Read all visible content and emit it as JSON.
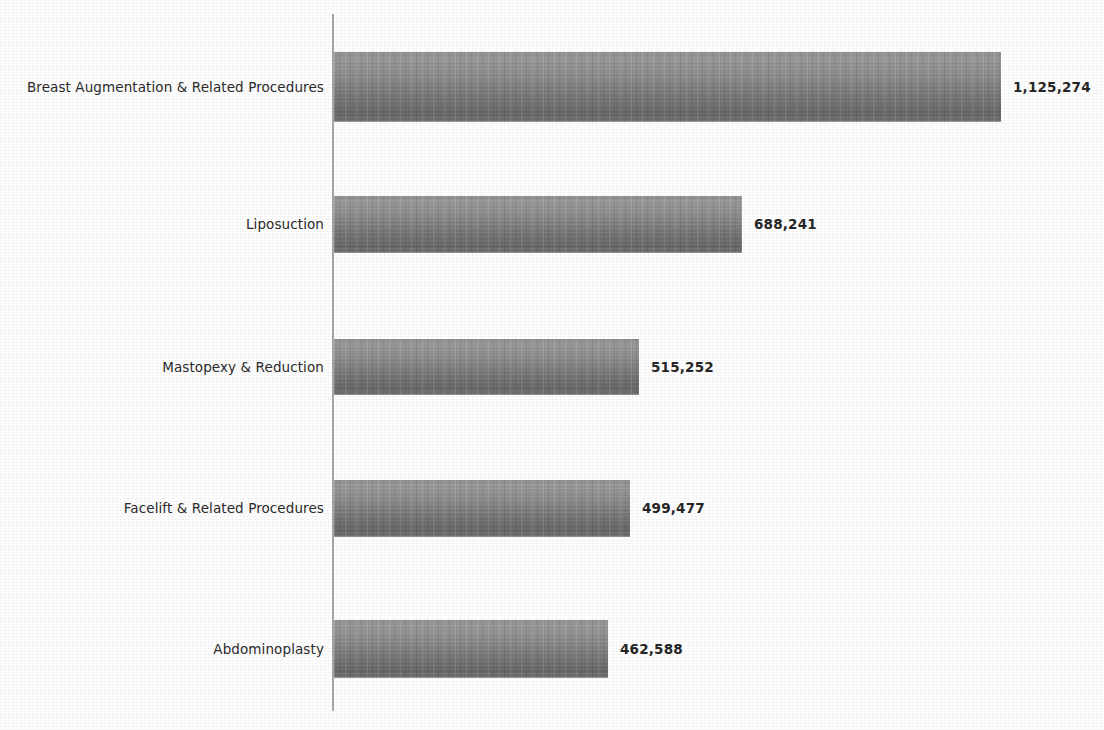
{
  "chart_data": {
    "type": "bar",
    "orientation": "horizontal",
    "title": "",
    "subtitle": "",
    "xlabel": "",
    "ylabel": "",
    "grid": false,
    "legend": false,
    "xlim": [
      0,
      1125274
    ],
    "categories": [
      "Breast Augmentation & Related Procedures",
      "Liposuction",
      "Mastopexy & Reduction",
      "Facelift & Related Procedures",
      "Abdominoplasty"
    ],
    "values": [
      1125274,
      688241,
      515252,
      499477,
      462588
    ],
    "value_labels": [
      "1,125,274",
      "688,241",
      "515,252",
      "499,477",
      "462,588"
    ],
    "bars": [
      {
        "category": "Breast Augmentation & Related Procedures",
        "value": 1125274,
        "label": "1,125,274"
      },
      {
        "category": "Liposuction",
        "value": 688241,
        "label": "688,241"
      },
      {
        "category": "Mastopexy & Reduction",
        "value": 515252,
        "label": "515,252"
      },
      {
        "category": "Facelift & Related Procedures",
        "value": 499477,
        "label": "499,477"
      },
      {
        "category": "Abdominoplasty",
        "value": 462588,
        "label": "462,588"
      }
    ]
  },
  "style": {
    "bar_color_top": "#979797",
    "bar_color_bottom": "#666666",
    "axis_color": "#a8a8a8",
    "text_color": "#2b2b2b",
    "value_text_color": "#262626",
    "background": "#fefefe"
  },
  "layout": {
    "axis_x": 332,
    "axis_top": 14,
    "axis_bottom": 711,
    "bar_origin_x": 334,
    "max_bar_width": 667,
    "bar_tops": [
      52,
      196,
      339,
      480,
      620
    ],
    "bar_heights": [
      70,
      57,
      56,
      57,
      58
    ],
    "value_label_gap": 12
  }
}
